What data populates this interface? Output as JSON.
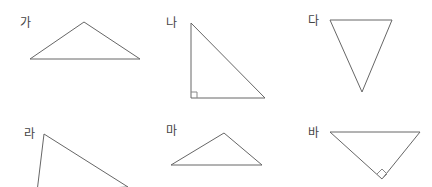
{
  "stroke_color": "#666666",
  "figures": [
    {
      "label": "가",
      "label_pos": [
        20,
        17
      ],
      "points": "30,59 84,22 140,59",
      "right_angle": null
    },
    {
      "label": "나",
      "label_pos": [
        166,
        17
      ],
      "points": "191,23 191,98 265,98",
      "right_angle": "191,92 197,92 197,98"
    },
    {
      "label": "다",
      "label_pos": [
        308,
        15
      ],
      "points": "330,20 392,20 362,92",
      "right_angle": null
    },
    {
      "label": "라",
      "label_pos": [
        24,
        128
      ],
      "points": "44,134 37,192 128,187",
      "right_angle": null
    },
    {
      "label": "마",
      "label_pos": [
        166,
        125
      ],
      "points": "171,165 224,133 262,165",
      "right_angle": null
    },
    {
      "label": "바",
      "label_pos": [
        308,
        127
      ],
      "points": "330,132 420,132 382,179",
      "right_angle": "377,174 382,169 387,174 382,179"
    }
  ]
}
